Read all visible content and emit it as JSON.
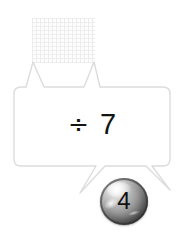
{
  "canvas": {
    "background": "#ffffff",
    "width": 184,
    "height": 242
  },
  "grid_swatch": {
    "name": "graph-paper-swatch",
    "line_color": "#e9e9e9",
    "fill_color": "#fdfdfd"
  },
  "bubble": {
    "name": "operation-bubble",
    "border_color": "#dcdcdc",
    "fill_color": "#ffffff",
    "expression": {
      "operator": "÷",
      "operand": "7",
      "full_text": "÷ 7",
      "text_color": "#141414"
    }
  },
  "sphere": {
    "name": "numbered-marble",
    "value": "4",
    "label_color": "#111111",
    "highlight_color": "#ffffff",
    "shadow_color": "#3a3a3a"
  }
}
